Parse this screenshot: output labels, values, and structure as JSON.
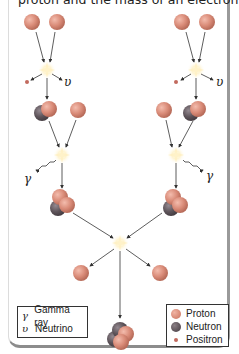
{
  "caption": "proton and the mass of an electron.",
  "diagram": {
    "labels": {
      "neutrino_symbol": "υ",
      "gamma_symbol": "γ"
    },
    "colors": {
      "proton": "#d98b78",
      "neutron": "#5e545a",
      "positron": "#c26a5e",
      "arrow": "#333333",
      "flash": "#fff4c8"
    }
  },
  "legend_left": {
    "items": [
      {
        "symbol": "γ",
        "label": "Gamma ray"
      },
      {
        "symbol": "υ",
        "label": "Neutrino"
      }
    ]
  },
  "legend_right": {
    "items": [
      {
        "label": "Proton"
      },
      {
        "label": "Neutron"
      },
      {
        "label": "Positron"
      }
    ]
  }
}
